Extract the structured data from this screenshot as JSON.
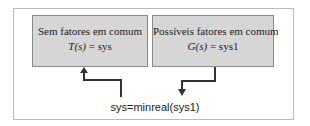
{
  "diagram": {
    "left_box": {
      "title": "Sem fatores em comum",
      "eq_func": "T",
      "eq_arg": "(s)",
      "eq_rhs": " = sys"
    },
    "right_box": {
      "title": "Possíveis fatores em comum",
      "eq_func": "G",
      "eq_arg": "(s)",
      "eq_rhs": " = sys1"
    },
    "command": "sys=minreal(sys1)",
    "colors": {
      "box_fill": "#d6d6d6",
      "box_border": "#8a8a8a",
      "frame_border": "#b9b9b9",
      "arrow": "#333333"
    }
  }
}
